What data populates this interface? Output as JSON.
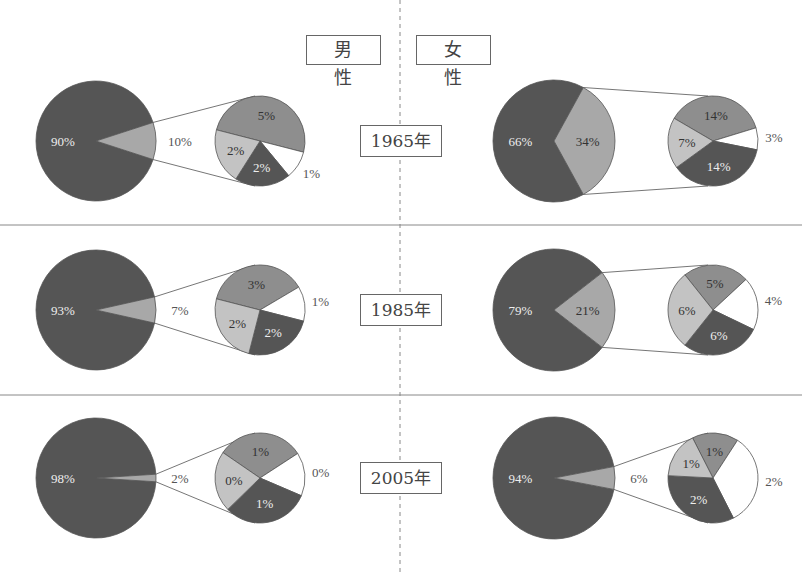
{
  "headers": {
    "male": "男　性",
    "female": "女　性"
  },
  "colors": {
    "dark": "#555555",
    "mid": "#8e8e8e",
    "light": "#c3c3c3",
    "white": "#ffffff",
    "line": "#666666"
  },
  "rows": [
    {
      "year_label": "1965年",
      "male": {
        "main": 90,
        "main_label": "90%",
        "rest": 10,
        "rest_label": "10%",
        "breakdown": [
          {
            "value": 5,
            "label": "5%",
            "color": "mid"
          },
          {
            "value": 1,
            "label": "1%",
            "color": "white"
          },
          {
            "value": 2,
            "label": "2%",
            "color": "dark"
          },
          {
            "value": 2,
            "label": "2%",
            "color": "light"
          }
        ]
      },
      "female": {
        "main": 66,
        "main_label": "66%",
        "rest": 34,
        "rest_label": "34%",
        "breakdown": [
          {
            "value": 14,
            "label": "14%",
            "color": "mid"
          },
          {
            "value": 3,
            "label": "3%",
            "color": "white"
          },
          {
            "value": 14,
            "label": "14%",
            "color": "dark"
          },
          {
            "value": 7,
            "label": "7%",
            "color": "light"
          }
        ]
      }
    },
    {
      "year_label": "1985年",
      "male": {
        "main": 93,
        "main_label": "93%",
        "rest": 7,
        "rest_label": "7%",
        "breakdown": [
          {
            "value": 3,
            "label": "3%",
            "color": "mid"
          },
          {
            "value": 1,
            "label": "1%",
            "color": "white"
          },
          {
            "value": 2,
            "label": "2%",
            "color": "dark"
          },
          {
            "value": 2,
            "label": "2%",
            "color": "light"
          }
        ]
      },
      "female": {
        "main": 79,
        "main_label": "79%",
        "rest": 21,
        "rest_label": "21%",
        "breakdown": [
          {
            "value": 5,
            "label": "5%",
            "color": "mid"
          },
          {
            "value": 4,
            "label": "4%",
            "color": "white"
          },
          {
            "value": 6,
            "label": "6%",
            "color": "dark"
          },
          {
            "value": 6,
            "label": "6%",
            "color": "light"
          }
        ]
      }
    },
    {
      "year_label": "2005年",
      "male": {
        "main": 98,
        "main_label": "98%",
        "rest": 2,
        "rest_label": "2%",
        "breakdown": [
          {
            "value": 1,
            "label": "1%",
            "color": "mid"
          },
          {
            "value": 0.5,
            "label": "0%",
            "color": "white"
          },
          {
            "value": 1,
            "label": "1%",
            "color": "dark"
          },
          {
            "value": 0.7,
            "label": "0%",
            "color": "light"
          }
        ]
      },
      "female": {
        "main": 94,
        "main_label": "94%",
        "rest": 6,
        "rest_label": "6%",
        "breakdown": [
          {
            "value": 1,
            "label": "1%",
            "color": "mid"
          },
          {
            "value": 2,
            "label": "2%",
            "color": "white"
          },
          {
            "value": 2,
            "label": "2%",
            "color": "dark"
          },
          {
            "value": 1,
            "label": "1%",
            "color": "light"
          }
        ]
      }
    }
  ],
  "chart_data": {
    "type": "pie",
    "title": "",
    "panels": [
      "男性",
      "女性"
    ],
    "categories": [
      "1965年",
      "1985年",
      "2005年"
    ],
    "series": [
      {
        "name": "男性 main slice",
        "values": [
          90,
          93,
          98
        ]
      },
      {
        "name": "男性 exploded slice",
        "values": [
          10,
          7,
          2
        ]
      },
      {
        "name": "女性 main slice",
        "values": [
          66,
          79,
          94
        ]
      },
      {
        "name": "女性 exploded slice",
        "values": [
          34,
          21,
          6
        ]
      }
    ],
    "breakdowns": {
      "男性": {
        "1965年": [
          5,
          1,
          2,
          2
        ],
        "1985年": [
          3,
          1,
          2,
          2
        ],
        "2005年": [
          1,
          0,
          1,
          0
        ]
      },
      "女性": {
        "1965年": [
          14,
          3,
          14,
          7
        ],
        "1985年": [
          5,
          4,
          6,
          6
        ],
        "2005年": [
          1,
          2,
          2,
          1
        ]
      }
    },
    "breakdown_order": [
      "medium gray",
      "white",
      "dark gray",
      "light gray"
    ],
    "legend": null,
    "grid": false
  }
}
